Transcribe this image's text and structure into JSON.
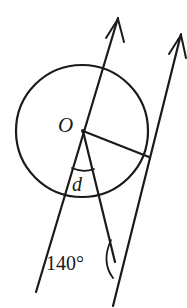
{
  "figure": {
    "type": "circle-geometry-diagram",
    "background_color": "#ffffff",
    "stroke_color": "#1a1a1a",
    "labels": {
      "center": "O",
      "unknown_angle": "d",
      "known_angle": "140°"
    },
    "circle": {
      "center_x": 82,
      "center_y": 131,
      "radius": 66,
      "stroke_width": 2.1
    },
    "center_dot": {
      "x": 83,
      "y": 131
    },
    "lines": [
      {
        "name": "transversal-line-left",
        "x1": 118,
        "y1": 18,
        "x2": 36,
        "y2": 292,
        "stroke_width": 2.1,
        "arrow": "up-right"
      },
      {
        "name": "transversal-line-right",
        "x1": 181,
        "y1": 34,
        "x2": 113,
        "y2": 306,
        "stroke_width": 2.1,
        "arrow": "up-right"
      }
    ],
    "radii": [
      {
        "name": "radius-to-tangent-point",
        "x1": 83,
        "y1": 131,
        "x2": 149,
        "y2": 157
      },
      {
        "name": "radius-along-chord",
        "x1": 83,
        "y1": 131,
        "x2": 115,
        "y2": 262
      }
    ],
    "arrow_marks": [
      {
        "name": "arrowhead-line-left",
        "tip_x": 118,
        "tip_y": 18
      },
      {
        "name": "arrowhead-line-right",
        "tip_x": 181,
        "tip_y": 34
      }
    ],
    "angle_arcs": [
      {
        "name": "angle-arc-d",
        "label": "d",
        "label_x": 80,
        "label_y": 188,
        "cx": 83,
        "cy": 131,
        "radius": 38
      },
      {
        "name": "angle-arc-140",
        "label": "140°",
        "label_x": 50,
        "label_y": 268,
        "vertex_x": 115,
        "vertex_y": 262,
        "radius": 24
      }
    ]
  }
}
